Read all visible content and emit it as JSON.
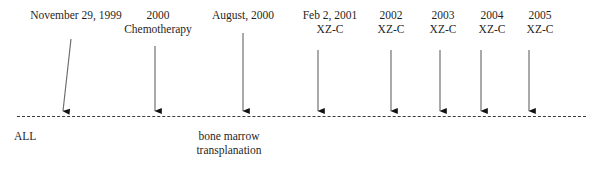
{
  "figure": {
    "width": 604,
    "height": 176,
    "background_color": "#ffffff",
    "text_color": "#1f1f1f",
    "axis": {
      "name": "timeline-axis",
      "style": "dashed",
      "color": "#3b3b3b",
      "x_start": 17,
      "x_end": 586,
      "y": 116
    }
  },
  "events": [
    {
      "id": "event-1999-11-29",
      "line1": "November 29, 1999",
      "line2": "",
      "label_x": 76,
      "label_y": 8,
      "arrow": {
        "x1": 71,
        "y1": 39,
        "x2": 63,
        "y2": 111,
        "slanted": true
      }
    },
    {
      "id": "event-2000-chemotherapy",
      "line1": "2000",
      "line2": "Chemotherapy",
      "label_x": 158,
      "label_y": 8,
      "arrow": {
        "x1": 155,
        "y1": 46,
        "x2": 155,
        "y2": 111,
        "slanted": false
      }
    },
    {
      "id": "event-2000-08",
      "line1": "August, 2000",
      "line2": "",
      "label_x": 243,
      "label_y": 8,
      "arrow": {
        "x1": 243,
        "y1": 33,
        "x2": 243,
        "y2": 111,
        "slanted": false
      }
    },
    {
      "id": "event-2001-02-02-xzc",
      "line1": "Feb 2, 2001",
      "line2": "XZ-C",
      "label_x": 330,
      "label_y": 8,
      "arrow": {
        "x1": 318,
        "y1": 50,
        "x2": 318,
        "y2": 111,
        "slanted": false
      }
    },
    {
      "id": "event-2002-xzc",
      "line1": "2002",
      "line2": "XZ-C",
      "label_x": 391,
      "label_y": 8,
      "arrow": {
        "x1": 391,
        "y1": 50,
        "x2": 391,
        "y2": 111,
        "slanted": false
      }
    },
    {
      "id": "event-2003-xzc",
      "line1": "2003",
      "line2": "XZ-C",
      "label_x": 443,
      "label_y": 8,
      "arrow": {
        "x1": 440,
        "y1": 50,
        "x2": 440,
        "y2": 111,
        "slanted": false
      }
    },
    {
      "id": "event-2004-xzc",
      "line1": "2004",
      "line2": "XZ-C",
      "label_x": 492,
      "label_y": 8,
      "arrow": {
        "x1": 481,
        "y1": 50,
        "x2": 481,
        "y2": 111,
        "slanted": false
      }
    },
    {
      "id": "event-2005-xzc",
      "line1": "2005",
      "line2": "XZ-C",
      "label_x": 540,
      "label_y": 8,
      "arrow": {
        "x1": 529,
        "y1": 50,
        "x2": 529,
        "y2": 111,
        "slanted": false
      }
    }
  ],
  "below_axis_captions": [
    {
      "id": "caption-all",
      "line1": "ALL",
      "line2": "",
      "x": 14,
      "y": 129,
      "centered": false
    },
    {
      "id": "caption-bone-marrow-transplanation",
      "line1": "bone marrow",
      "line2": "transplanation",
      "x": 229,
      "y": 129,
      "centered": true
    }
  ]
}
